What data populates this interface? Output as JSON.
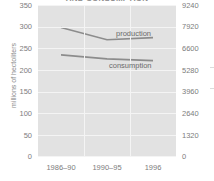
{
  "chart_data": {
    "type": "line",
    "title": "AND CONSUMPTION",
    "categories": [
      "1986–90",
      "1990–95",
      "1996"
    ],
    "series": [
      {
        "name": "production",
        "label": "production",
        "values": [
          298,
          270,
          275
        ]
      },
      {
        "name": "consumption",
        "label": "consumption",
        "values": [
          235,
          226,
          222
        ]
      }
    ],
    "xlabel": "",
    "ylabel": "millions of hectoliters",
    "ylim": [
      0,
      350
    ],
    "yticks": [
      0,
      50,
      100,
      150,
      200,
      250,
      300,
      350
    ],
    "y2lim": [
      0,
      9240
    ],
    "y2ticks": [
      0,
      1320,
      2640,
      3960,
      5280,
      6600,
      7920,
      9240
    ],
    "grid": true,
    "legend_position": "inline-annotations",
    "line_color": "#8c8c8c",
    "plot_bg_color": "#e2e2e2",
    "grid_color": "#f4f4f4",
    "text_color": "#7d7d7d"
  },
  "axes": {
    "left": {
      "title": "millions of hectoliters",
      "ticks": [
        "350",
        "300",
        "250",
        "200",
        "150",
        "100",
        "50",
        "0"
      ]
    },
    "right": {
      "title": "",
      "ticks": [
        "9240",
        "7920",
        "6600",
        "5280",
        "3960",
        "2640",
        "1320",
        "0"
      ]
    },
    "bottom": {
      "ticks": [
        "1986–90",
        "1990–95",
        "1996"
      ]
    }
  },
  "annotations": {
    "production": "production",
    "consumption": "consumption"
  }
}
